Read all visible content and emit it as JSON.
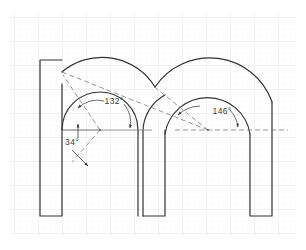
{
  "drawing": {
    "title": "Lowercase m letterform construction drawing",
    "paper": {
      "background_color": "#ffffff",
      "grid": {
        "minor_color": "#f2f2f2",
        "major_color": "#e6e6e6",
        "minor_spacing": 6,
        "major_spacing": 24,
        "origin_x": 14,
        "origin_y": 17,
        "visible": true
      }
    },
    "styles": {
      "outline_color": "#333333",
      "outline_width": 1.2,
      "construction_color": "#6b6b6b",
      "construction_width": 0.7,
      "dimension_color": "#4a4a4a",
      "dash_pattern": "5,3"
    },
    "geometry": {
      "baseline_y": 216,
      "left_stem": {
        "x_left": 40,
        "x_right": 62,
        "y_top": 60,
        "y_bottom": 216
      },
      "middle_stem": {
        "x_left": 143,
        "x_right": 165,
        "y_bottom": 216
      },
      "right_stem": {
        "x_left": 250,
        "x_right": 272,
        "y_bottom": 216
      },
      "arch_one": {
        "center_x": 100,
        "center_y": 130,
        "outer_radius": 60,
        "inner_radius": 38
      },
      "arch_two": {
        "center_x": 208,
        "center_y": 130,
        "outer_radius": 64,
        "inner_radius": 42
      }
    },
    "dimensions": [
      {
        "id": "angle-34",
        "label": "34°",
        "value": 34,
        "unit": "degrees",
        "label_x": 72,
        "label_y": 143,
        "reference": "horizontal baseline at arch-one center"
      },
      {
        "id": "angle-132",
        "label": "132°",
        "value": 132,
        "unit": "degrees",
        "label_x": 111,
        "label_y": 102,
        "reference": "arch-one included sweep"
      },
      {
        "id": "angle-146",
        "label": "146°",
        "value": 146,
        "unit": "degrees",
        "label_x": 218,
        "label_y": 113,
        "reference": "arch-two included sweep"
      }
    ]
  }
}
